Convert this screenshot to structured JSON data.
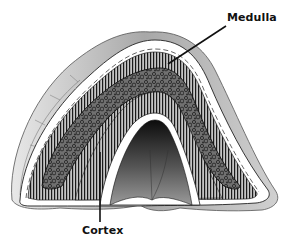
{
  "diagram": {
    "labels": {
      "medulla": "Medulla",
      "cortex": "Cortex"
    },
    "colors": {
      "background": "#ffffff",
      "capsule_outer": "#d9d9d9",
      "capsule_shade": "#9a9a9a",
      "cortex_fill": "#bdbdbd",
      "cortex_stripes": "#1a1a1a",
      "medulla_fill": "#6e6e6e",
      "medulla_texture": "#222222",
      "hilum_dark": "#111111",
      "leader_line": "#111111",
      "label_text": "#111111"
    }
  }
}
